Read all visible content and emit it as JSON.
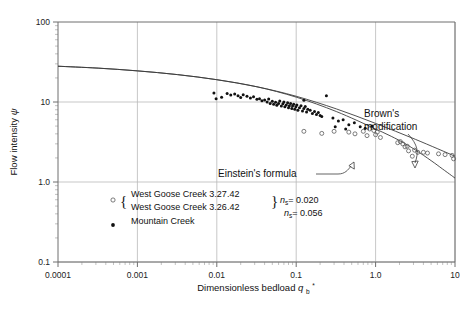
{
  "chart_data": {
    "type": "scatter",
    "title": "",
    "xlabel": "Dimensionless bedload",
    "xlabel_symbol": "q",
    "xlabel_symbol_sub": "b",
    "xlabel_symbol_sup": "*",
    "ylabel": "Flow intensity",
    "ylabel_symbol": "ψ",
    "xscale": "log",
    "yscale": "log",
    "xlim": [
      0.0001,
      10
    ],
    "ylim": [
      0.1,
      100
    ],
    "grid": true,
    "legend_position": "inside-lower-left",
    "xticks": [
      "0.0001",
      "0.001",
      "0.01",
      "0.1",
      "1.0",
      "10"
    ],
    "xtick_values": [
      0.0001,
      0.001,
      0.01,
      0.1,
      1.0,
      10
    ],
    "yticks": [
      "100",
      "10",
      "1.0",
      "0.1"
    ],
    "ytick_values": [
      100,
      10,
      1.0,
      0.1
    ],
    "series": [
      {
        "name": "West Goose Creek 3.27.42",
        "marker": "open-circle",
        "n_label": "0.020",
        "points": [
          [
            0.125,
            4.3
          ],
          [
            0.3,
            4.3
          ],
          [
            0.46,
            4.2
          ],
          [
            0.7,
            4.3
          ],
          [
            0.78,
            3.8
          ],
          [
            0.95,
            4.4
          ],
          [
            1.0,
            3.9
          ],
          [
            1.15,
            3.6
          ],
          [
            1.9,
            3.1
          ],
          [
            2.2,
            3.0
          ],
          [
            2.5,
            2.8
          ],
          [
            2.6,
            2.45
          ],
          [
            3.1,
            2.5
          ],
          [
            4.5,
            2.3
          ],
          [
            7.5,
            2.2
          ],
          [
            9.2,
            2.15
          ],
          [
            9.6,
            1.95
          ],
          [
            2.9,
            2.1
          ],
          [
            3.4,
            2.35
          ]
        ]
      },
      {
        "name": "West Goose Creek 3.26.42",
        "marker": "open-circle",
        "n_label": "0.020",
        "points": [
          [
            0.21,
            4.05
          ],
          [
            0.55,
            4.0
          ],
          [
            0.84,
            4.6
          ],
          [
            1.05,
            4.2
          ],
          [
            2.05,
            3.2
          ],
          [
            2.35,
            2.75
          ],
          [
            4.0,
            2.35
          ],
          [
            6.2,
            2.25
          ]
        ]
      },
      {
        "name": "Mountain Creek",
        "marker": "filled-circle",
        "n_label": "0.056",
        "points": [
          [
            0.0092,
            13.0
          ],
          [
            0.0098,
            11.0
          ],
          [
            0.0115,
            11.5
          ],
          [
            0.0135,
            12.8
          ],
          [
            0.015,
            12.2
          ],
          [
            0.0168,
            12.6
          ],
          [
            0.0185,
            12.0
          ],
          [
            0.02,
            11.4
          ],
          [
            0.0215,
            12.3
          ],
          [
            0.024,
            11.8
          ],
          [
            0.0265,
            11.2
          ],
          [
            0.029,
            11.6
          ],
          [
            0.032,
            10.8
          ],
          [
            0.0345,
            11.0
          ],
          [
            0.037,
            10.4
          ],
          [
            0.04,
            10.6
          ],
          [
            0.043,
            10.0
          ],
          [
            0.045,
            10.9
          ],
          [
            0.047,
            9.6
          ],
          [
            0.05,
            10.2
          ],
          [
            0.052,
            9.4
          ],
          [
            0.055,
            9.9
          ],
          [
            0.057,
            9.1
          ],
          [
            0.06,
            9.6
          ],
          [
            0.062,
            10.3
          ],
          [
            0.065,
            8.9
          ],
          [
            0.068,
            9.5
          ],
          [
            0.07,
            10.0
          ],
          [
            0.072,
            8.7
          ],
          [
            0.075,
            9.2
          ],
          [
            0.078,
            9.8
          ],
          [
            0.08,
            8.5
          ],
          [
            0.082,
            9.0
          ],
          [
            0.085,
            9.6
          ],
          [
            0.088,
            8.3
          ],
          [
            0.09,
            8.9
          ],
          [
            0.093,
            9.4
          ],
          [
            0.096,
            8.1
          ],
          [
            0.099,
            8.7
          ],
          [
            0.102,
            9.2
          ],
          [
            0.105,
            7.9
          ],
          [
            0.11,
            8.5
          ],
          [
            0.115,
            9.0
          ],
          [
            0.12,
            7.7
          ],
          [
            0.125,
            8.3
          ],
          [
            0.13,
            8.8
          ],
          [
            0.135,
            7.5
          ],
          [
            0.14,
            8.1
          ],
          [
            0.15,
            7.9
          ],
          [
            0.16,
            7.2
          ],
          [
            0.17,
            7.6
          ],
          [
            0.18,
            7.0
          ],
          [
            0.19,
            7.4
          ],
          [
            0.2,
            6.8
          ],
          [
            0.125,
            10.5
          ],
          [
            0.21,
            6.6
          ],
          [
            0.24,
            12.0
          ],
          [
            0.29,
            6.3
          ],
          [
            0.34,
            5.8
          ],
          [
            0.39,
            6.0
          ],
          [
            0.46,
            5.2
          ],
          [
            0.54,
            5.5
          ],
          [
            0.64,
            4.9
          ],
          [
            0.74,
            4.7
          ],
          [
            0.9,
            5.0
          ],
          [
            0.42,
            4.6
          ],
          [
            0.31,
            4.9
          ]
        ]
      }
    ],
    "curves": [
      {
        "name": "Brown's modification",
        "annotation": "Brown's modification",
        "points": [
          [
            0.0001,
            28.0
          ],
          [
            0.00032,
            26.5
          ],
          [
            0.001,
            24.5
          ],
          [
            0.0032,
            22.0
          ],
          [
            0.01,
            19.0
          ],
          [
            0.032,
            15.5
          ],
          [
            0.1,
            11.8
          ],
          [
            0.32,
            8.2
          ],
          [
            1.0,
            5.4
          ],
          [
            3.2,
            3.4
          ],
          [
            10.0,
            2.1
          ]
        ]
      },
      {
        "name": "Einstein's formula",
        "annotation": "Einstein's formula",
        "points": [
          [
            0.0001,
            28.0
          ],
          [
            0.00032,
            26.5
          ],
          [
            0.001,
            24.5
          ],
          [
            0.0032,
            22.0
          ],
          [
            0.01,
            19.0
          ],
          [
            0.032,
            15.5
          ],
          [
            0.1,
            11.5
          ],
          [
            0.32,
            7.6
          ],
          [
            1.0,
            4.6
          ],
          [
            2.0,
            3.3
          ],
          [
            3.2,
            2.5
          ],
          [
            5.0,
            1.85
          ],
          [
            7.0,
            1.45
          ],
          [
            10.0,
            1.12
          ]
        ]
      }
    ],
    "annotations": [
      {
        "text_line1": "Brown's",
        "text_line2": "modification"
      },
      {
        "text_line1": "Einstein's formula",
        "text_line2": ""
      }
    ],
    "legend": {
      "entries": [
        {
          "marker": "open-circle",
          "label": "West Goose Creek 3.27.42"
        },
        {
          "marker": "open-circle",
          "label": "West Goose Creek 3.26.42"
        },
        {
          "marker": "filled-circle",
          "label": "Mountain Creek"
        }
      ],
      "n_values": [
        {
          "symbol": "n",
          "sub": "s",
          "value": "0.020"
        },
        {
          "symbol": "n",
          "sub": "s",
          "value": "0.056"
        }
      ]
    }
  }
}
